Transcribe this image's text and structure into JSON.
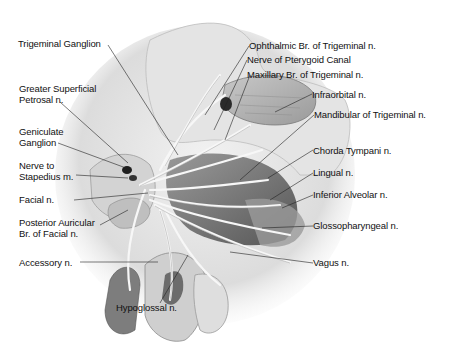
{
  "figure": {
    "colors": {
      "background": "#ffffff",
      "label_text": "#111111",
      "leader_line": "#222222",
      "tissue_light": "#e6e6e6",
      "tissue_mid": "#b5b5b5",
      "tissue_dark": "#6e6e6e",
      "nerve": "#f4f4f4"
    }
  },
  "labels_left": [
    {
      "id": "trigeminal-ganglion",
      "text": "Trigeminal Ganglion"
    },
    {
      "id": "greater-superficial-petrosal",
      "text": "Greater Superficial\nPetrosal n."
    },
    {
      "id": "geniculate-ganglion",
      "text": "Geniculate\nGanglion"
    },
    {
      "id": "nerve-to-stapedius",
      "text": "Nerve to\nStapedius m."
    },
    {
      "id": "facial-nerve",
      "text": "Facial n."
    },
    {
      "id": "posterior-auricular",
      "text": "Posterior Auricular\nBr. of Facial n."
    },
    {
      "id": "accessory-nerve",
      "text": "Accessory n."
    }
  ],
  "labels_right": [
    {
      "id": "ophthalmic-branch",
      "text": "Ophthalmic Br. of Trigeminal n."
    },
    {
      "id": "nerve-pterygoid-canal",
      "text": "Nerve of Pterygoid Canal"
    },
    {
      "id": "maxillary-branch",
      "text": "Maxillary Br. of Trigeminal n."
    },
    {
      "id": "infraorbital",
      "text": "Infraorbital n."
    },
    {
      "id": "mandibular",
      "text": "Mandibular of Trigeminal n."
    },
    {
      "id": "chorda-tympani",
      "text": "Chorda Tympani n."
    },
    {
      "id": "lingual",
      "text": "Lingual n."
    },
    {
      "id": "inferior-alveolar",
      "text": "Inferior Alveolar n."
    },
    {
      "id": "glossopharyngeal",
      "text": "Glossopharyngeal n."
    },
    {
      "id": "vagus",
      "text": "Vagus n."
    }
  ],
  "labels_bottom": [
    {
      "id": "hypoglossal",
      "text": "Hypoglossal n."
    }
  ]
}
